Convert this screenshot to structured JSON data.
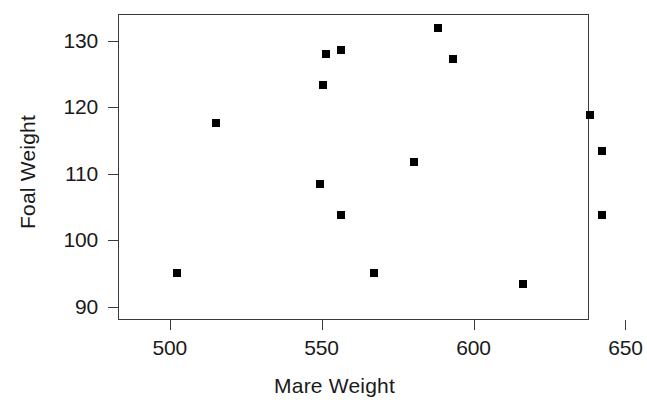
{
  "chart_data": {
    "type": "scatter",
    "title": "",
    "xlabel": "Mare Weight",
    "ylabel": "Foal Weight",
    "xlim": [
      483,
      638
    ],
    "ylim": [
      88.0,
      134.0
    ],
    "xticks": [
      500,
      550,
      600,
      650
    ],
    "yticks": [
      90,
      100,
      110,
      120,
      130
    ],
    "xtick_labels": [
      "500",
      "550",
      "600",
      "650"
    ],
    "ytick_labels": [
      "90",
      "100",
      "110",
      "120",
      "130"
    ],
    "grid": false,
    "legend": null,
    "marker": {
      "shape": "square",
      "color": "#000000",
      "size_px": 8
    },
    "frame": {
      "color": "#3a3a3a",
      "box": true
    },
    "points": [
      {
        "x": 502,
        "y": 95.2
      },
      {
        "x": 515,
        "y": 117.7
      },
      {
        "x": 549,
        "y": 108.6
      },
      {
        "x": 550,
        "y": 123.5
      },
      {
        "x": 551,
        "y": 128.1
      },
      {
        "x": 556,
        "y": 128.8
      },
      {
        "x": 556,
        "y": 104.0
      },
      {
        "x": 567,
        "y": 95.2
      },
      {
        "x": 580,
        "y": 111.9
      },
      {
        "x": 588,
        "y": 132.0
      },
      {
        "x": 593,
        "y": 127.4
      },
      {
        "x": 616,
        "y": 93.6
      },
      {
        "x": 638,
        "y": 119.0
      },
      {
        "x": 642,
        "y": 113.5
      },
      {
        "x": 642,
        "y": 104.0
      }
    ]
  }
}
